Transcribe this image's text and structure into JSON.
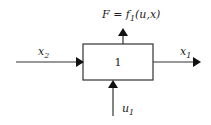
{
  "diagram": {
    "block": {
      "label": "1"
    },
    "output_top": {
      "label_main": "F = f",
      "label_sub": "1",
      "label_args": "(u,x)"
    },
    "input_left": {
      "label_main": "x",
      "label_sub": "2"
    },
    "output_right": {
      "label_main": "x",
      "label_sub": "1"
    },
    "input_bottom": {
      "label_main": "u",
      "label_sub": "1"
    },
    "colors": {
      "stroke": "#333333",
      "arrowhead": "#111111",
      "background": "#ffffff"
    }
  }
}
